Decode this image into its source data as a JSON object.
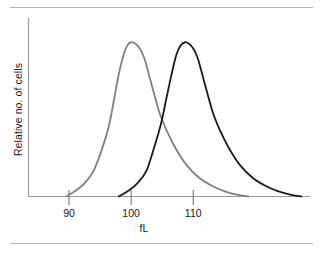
{
  "figure": {
    "background_color": "#ffffff",
    "rule_color": "#b4b4b4",
    "top_rule_name": "top-divider",
    "bottom_rule_name": "bottom-divider"
  },
  "chart_data": {
    "type": "line",
    "title": "",
    "subtitle": "",
    "xlabel": "fL",
    "ylabel": "Relative no. of cells",
    "xlim": [
      83.4,
      128.8
    ],
    "ylim": [
      0,
      1.06
    ],
    "grid": false,
    "legend": false,
    "legend_position": "none",
    "x_ticks": [
      90,
      100,
      110
    ],
    "x_tick_labels": [
      "90",
      "100",
      "110"
    ],
    "y_ticks": [],
    "y_tick_labels": [],
    "axis_color": "#9a9a9a",
    "annotations": [],
    "series": [
      {
        "name": "left-distribution",
        "color": "#808080",
        "line_width": 1.8,
        "peak_x": 100.0,
        "peak_y": 1.0,
        "x": [
          89.5,
          91.0,
          92.5,
          94.0,
          95.5,
          96.5,
          97.3,
          98.0,
          98.8,
          99.4,
          100.0,
          100.7,
          101.4,
          102.1,
          102.8,
          103.6,
          104.6,
          105.8,
          107.2,
          109.0,
          111.0,
          113.0,
          115.0,
          117.0,
          118.9
        ],
        "y": [
          0.0,
          0.035,
          0.085,
          0.17,
          0.33,
          0.47,
          0.64,
          0.79,
          0.92,
          0.98,
          1.0,
          0.99,
          0.96,
          0.9,
          0.8,
          0.68,
          0.54,
          0.42,
          0.31,
          0.2,
          0.12,
          0.07,
          0.035,
          0.012,
          0.0
        ]
      },
      {
        "name": "right-distribution",
        "color": "#1a1a1a",
        "line_width": 1.8,
        "peak_x": 108.5,
        "peak_y": 1.0,
        "x": [
          98.0,
          99.5,
          101.0,
          102.5,
          103.8,
          104.8,
          105.7,
          106.5,
          107.3,
          108.0,
          108.7,
          109.3,
          110.0,
          110.7,
          111.4,
          112.2,
          113.2,
          114.4,
          115.8,
          117.6,
          119.6,
          121.6,
          123.6,
          125.6,
          127.4
        ],
        "y": [
          0.0,
          0.035,
          0.085,
          0.17,
          0.33,
          0.47,
          0.64,
          0.79,
          0.92,
          0.98,
          1.0,
          0.99,
          0.96,
          0.9,
          0.8,
          0.68,
          0.54,
          0.42,
          0.31,
          0.2,
          0.12,
          0.07,
          0.035,
          0.012,
          0.0
        ]
      }
    ]
  }
}
